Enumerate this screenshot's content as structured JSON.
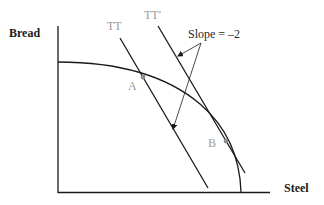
{
  "diagram": {
    "type": "production-possibility-frontier",
    "axes": {
      "y_label": "Bread",
      "x_label": "Steel"
    },
    "lines": [
      {
        "id": "TT",
        "label": "TT"
      },
      {
        "id": "TTprime",
        "label": "TT′"
      }
    ],
    "points": [
      {
        "id": "A",
        "label": "A"
      },
      {
        "id": "B",
        "label": "B"
      }
    ],
    "annotation": {
      "text": "Slope = –2",
      "points_to": [
        "TT",
        "TT′"
      ]
    },
    "colors": {
      "line": "#1a1a1a",
      "label_gray": "#9a9a9a",
      "point_gray": "#8c8c8c"
    }
  }
}
